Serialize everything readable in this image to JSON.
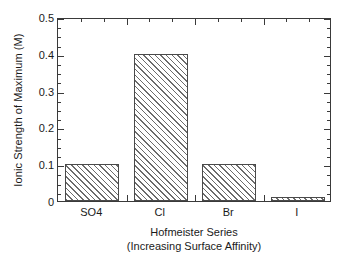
{
  "chart_data": {
    "type": "bar",
    "title": "",
    "categories": [
      "SO4",
      "Cl",
      "Br",
      "I"
    ],
    "values": [
      0.1,
      0.4,
      0.1,
      0.01
    ],
    "series": [
      {
        "name": "Ionic Strength of Maximum",
        "values": [
          0.1,
          0.4,
          0.1,
          0.01
        ]
      }
    ],
    "xlabel": "Hofmeister Series",
    "xlabel_line2": "(Increasing Surface Affinity)",
    "ylabel": "Ionic Strength of Maximum (M)",
    "ylim": [
      0,
      0.5
    ],
    "ytick_labels": [
      "0",
      "0.1",
      "0.2",
      "0.3",
      "0.4",
      "0.5"
    ],
    "ytick_values": [
      0,
      0.1,
      0.2,
      0.3,
      0.4,
      0.5
    ],
    "yminor_step": 0.025,
    "grid": false,
    "legend": "none",
    "bar_fill": "diagonal-hatch",
    "bar_fill_color": "#6b6b6b",
    "axis_color": "#3a3a3a",
    "background": "#ffffff"
  },
  "axes": {
    "y_title": "Ionic Strength of Maximum (M)",
    "x_title_line1": "Hofmeister Series",
    "x_title_line2": "(Increasing Surface Affinity)"
  },
  "ticks": {
    "y": [
      {
        "label": "0.5",
        "value": 0.5
      },
      {
        "label": "0.4",
        "value": 0.4
      },
      {
        "label": "0.3",
        "value": 0.3
      },
      {
        "label": "0.2",
        "value": 0.2
      },
      {
        "label": "0.1",
        "value": 0.1
      },
      {
        "label": "0",
        "value": 0
      }
    ],
    "x": [
      {
        "label": "SO4",
        "value": 0.1
      },
      {
        "label": "Cl",
        "value": 0.4
      },
      {
        "label": "Br",
        "value": 0.1
      },
      {
        "label": "I",
        "value": 0.01
      }
    ]
  }
}
